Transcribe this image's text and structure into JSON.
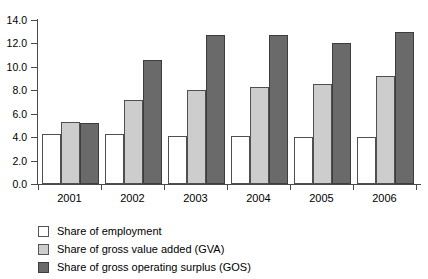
{
  "chart_data": {
    "type": "bar",
    "title": "",
    "subtitle": "",
    "xlabel": "",
    "ylabel": "",
    "categories": [
      "2001",
      "2002",
      "2003",
      "2004",
      "2005",
      "2006"
    ],
    "series": [
      {
        "name": "Share of employment",
        "color": "#ffffff",
        "values": [
          4.3,
          4.3,
          4.1,
          4.1,
          4.0,
          4.0
        ]
      },
      {
        "name": "Share of gross value added (GVA)",
        "color": "#cdcdcd",
        "values": [
          5.3,
          7.2,
          8.0,
          8.3,
          8.5,
          9.2
        ]
      },
      {
        "name": "Share of gross operating surplus (GOS)",
        "color": "#6a6a6a",
        "values": [
          5.2,
          10.6,
          12.7,
          12.7,
          12.0,
          13.0
        ]
      }
    ],
    "ylim": [
      0.0,
      14.0
    ],
    "yticks": [
      0.0,
      2.0,
      4.0,
      6.0,
      8.0,
      10.0,
      12.0,
      14.0
    ],
    "ytick_labels": [
      "0.0",
      "2.0",
      "4.0",
      "6.0",
      "8.0",
      "10.0",
      "12.0",
      "14.0"
    ],
    "grid": false,
    "legend_position": "below",
    "legend": [
      "Share of employment",
      "Share of gross value added (GVA)",
      "Share of gross operating surplus (GOS)"
    ]
  }
}
